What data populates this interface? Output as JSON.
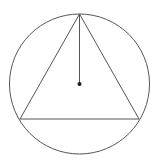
{
  "diagram": {
    "colors": {
      "background": "#ffffff",
      "stroke": "#555555",
      "center_dot": "#1a1a1a"
    },
    "circle": {
      "cx": 79.5,
      "cy": 84,
      "r": 70
    },
    "triangle": {
      "vertices": [
        {
          "name": "top",
          "x": 79.5,
          "y": 14
        },
        {
          "name": "bottom-left",
          "x": 20,
          "y": 119
        },
        {
          "name": "bottom-right",
          "x": 139,
          "y": 119
        }
      ]
    },
    "radius_segment": {
      "x1": 79.5,
      "y1": 14,
      "x2": 79.5,
      "y2": 84
    },
    "center_point": {
      "x": 79.5,
      "y": 84,
      "r": 2
    }
  }
}
